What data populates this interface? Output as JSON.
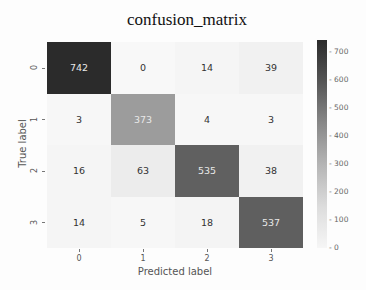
{
  "chart_data": {
    "type": "heatmap",
    "title": "confusion_matrix",
    "xlabel": "Predicted label",
    "ylabel": "True label",
    "x_categories": [
      "0",
      "1",
      "2",
      "3"
    ],
    "y_categories": [
      "0",
      "1",
      "2",
      "3"
    ],
    "values": [
      [
        742,
        0,
        14,
        39
      ],
      [
        3,
        373,
        4,
        3
      ],
      [
        16,
        63,
        535,
        38
      ],
      [
        14,
        5,
        18,
        537
      ]
    ],
    "colormap": "Greys",
    "colorbar": {
      "range": [
        0,
        750
      ],
      "ticks": [
        "0",
        "100",
        "200",
        "300",
        "400",
        "500",
        "600",
        "700"
      ]
    }
  },
  "cells": [
    {
      "v": "742",
      "bg": "#2b2b2b",
      "light": true
    },
    {
      "v": "0",
      "bg": "#f8f8f8",
      "light": false
    },
    {
      "v": "14",
      "bg": "#f5f5f5",
      "light": false
    },
    {
      "v": "39",
      "bg": "#f1f1f1",
      "light": false
    },
    {
      "v": "3",
      "bg": "#f7f7f7",
      "light": false
    },
    {
      "v": "373",
      "bg": "#9c9c9c",
      "light": true
    },
    {
      "v": "4",
      "bg": "#f7f7f7",
      "light": false
    },
    {
      "v": "3",
      "bg": "#f7f7f7",
      "light": false
    },
    {
      "v": "16",
      "bg": "#f5f5f5",
      "light": false
    },
    {
      "v": "63",
      "bg": "#ececec",
      "light": false
    },
    {
      "v": "535",
      "bg": "#606060",
      "light": true
    },
    {
      "v": "38",
      "bg": "#f1f1f1",
      "light": false
    },
    {
      "v": "14",
      "bg": "#f5f5f5",
      "light": false
    },
    {
      "v": "5",
      "bg": "#f7f7f7",
      "light": false
    },
    {
      "v": "18",
      "bg": "#f4f4f4",
      "light": false
    },
    {
      "v": "537",
      "bg": "#5f5f5f",
      "light": true
    }
  ]
}
